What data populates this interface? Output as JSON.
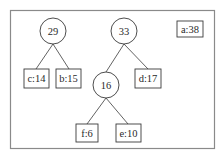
{
  "diagram": {
    "internal_nodes": [
      {
        "id": "n29",
        "label": "29"
      },
      {
        "id": "n33",
        "label": "33"
      },
      {
        "id": "n16",
        "label": "16"
      }
    ],
    "leaf_nodes": [
      {
        "id": "c",
        "label": "c:14"
      },
      {
        "id": "b",
        "label": "b:15"
      },
      {
        "id": "d",
        "label": "d:17"
      },
      {
        "id": "f",
        "label": "f:6"
      },
      {
        "id": "e",
        "label": "e:10"
      },
      {
        "id": "a",
        "label": "a:38"
      }
    ],
    "edges": [
      {
        "from": "n29",
        "to": "c"
      },
      {
        "from": "n29",
        "to": "b"
      },
      {
        "from": "n33",
        "to": "n16"
      },
      {
        "from": "n33",
        "to": "d"
      },
      {
        "from": "n16",
        "to": "f"
      },
      {
        "from": "n16",
        "to": "e"
      }
    ]
  }
}
